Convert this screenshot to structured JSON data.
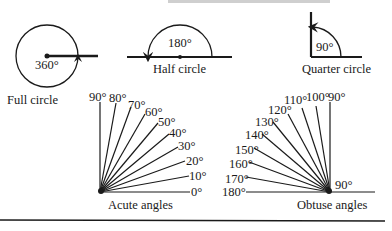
{
  "diagram": {
    "title_partial": "TYPES OF ANGLES",
    "full_circle": {
      "angle_label": "360°",
      "caption": "Full circle"
    },
    "half_circle": {
      "angle_label": "180°",
      "caption": "Half circle"
    },
    "quarter_circle": {
      "angle_label": "90°",
      "caption": "Quarter circle"
    },
    "acute": {
      "caption": "Acute angles",
      "labels": [
        "0°",
        "10°",
        "20°",
        "30°",
        "40°",
        "50°",
        "60°",
        "70°",
        "80°",
        "90°"
      ]
    },
    "obtuse": {
      "caption": "Obtuse angles",
      "right_label": "90°",
      "labels": [
        "90°",
        "100°",
        "110°",
        "120°",
        "130°",
        "140°",
        "150°",
        "160°",
        "170°",
        "180°"
      ]
    },
    "colors": {
      "ink": "#1a1a1a",
      "background": "#ffffff"
    }
  }
}
